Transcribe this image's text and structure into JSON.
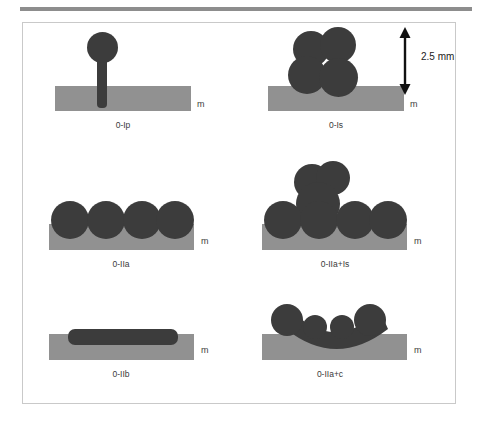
{
  "figure": {
    "background_color": "#ffffff",
    "frame_border_color": "#c9c9c9",
    "top_rule_color": "#8d8d8d",
    "particle_color": "#3c3c3c",
    "substrate_color": "#919191",
    "substrate_label": "m",
    "dimension_annotation": {
      "value": "2.5 mm",
      "arrow_style": "double-headed-vertical"
    }
  },
  "panels": [
    {
      "id": "panel-0-Ip",
      "caption": "0-Ip",
      "substrate_label": "m",
      "morphology": "single sphere on a stem penetrating the membrane",
      "sphere_count": 1
    },
    {
      "id": "panel-0-Is",
      "caption": "0-Is",
      "substrate_label": "m",
      "morphology": "cluster of spheres sitting on the membrane",
      "sphere_count": 4,
      "dimension_label": "2.5 mm"
    },
    {
      "id": "panel-0-IIa",
      "caption": "0-IIa",
      "substrate_label": "m",
      "morphology": "row of four spheres resting on the membrane",
      "sphere_count": 4
    },
    {
      "id": "panel-0-IIa-Is",
      "caption": "0-IIa+Is",
      "substrate_label": "m",
      "morphology": "row of four spheres with an additional cluster on top",
      "sphere_count": 7
    },
    {
      "id": "panel-0-IIb",
      "caption": "0-IIb",
      "substrate_label": "m",
      "morphology": "continuous rod lying on the membrane",
      "sphere_count": 0
    },
    {
      "id": "panel-0-IIa-c",
      "caption": "0-IIa+c",
      "substrate_label": "m",
      "morphology": "four spheres joined by a concave connecting band",
      "sphere_count": 4
    }
  ]
}
